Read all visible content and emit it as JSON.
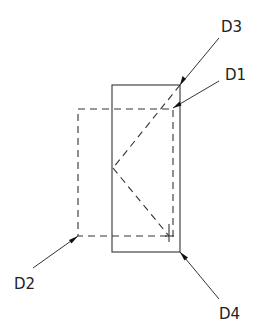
{
  "diagram": {
    "type": "technical-drawing",
    "labels": {
      "d1": "D1",
      "d2": "D2",
      "d3": "D3",
      "d4": "D4"
    },
    "shapes": {
      "solid_rect": {
        "x": 112,
        "y": 85,
        "width": 68,
        "height": 167
      },
      "dashed_rect": {
        "x": 78,
        "y": 109,
        "width": 95,
        "height": 127
      },
      "dashed_v": {
        "top": [
          180,
          85
        ],
        "apex": [
          113,
          168
        ],
        "bottom": [
          169,
          236
        ]
      }
    },
    "leaders": [
      {
        "label": "D3",
        "from": [
          219,
          38
        ],
        "to": [
          180,
          85
        ]
      },
      {
        "label": "D1",
        "from": [
          219,
          81
        ],
        "to": [
          173,
          108
        ]
      },
      {
        "label": "D2",
        "from": [
          33,
          268
        ],
        "to": [
          78,
          236
        ]
      },
      {
        "label": "D4",
        "from": [
          219,
          299
        ],
        "to": [
          180,
          252
        ]
      }
    ]
  }
}
